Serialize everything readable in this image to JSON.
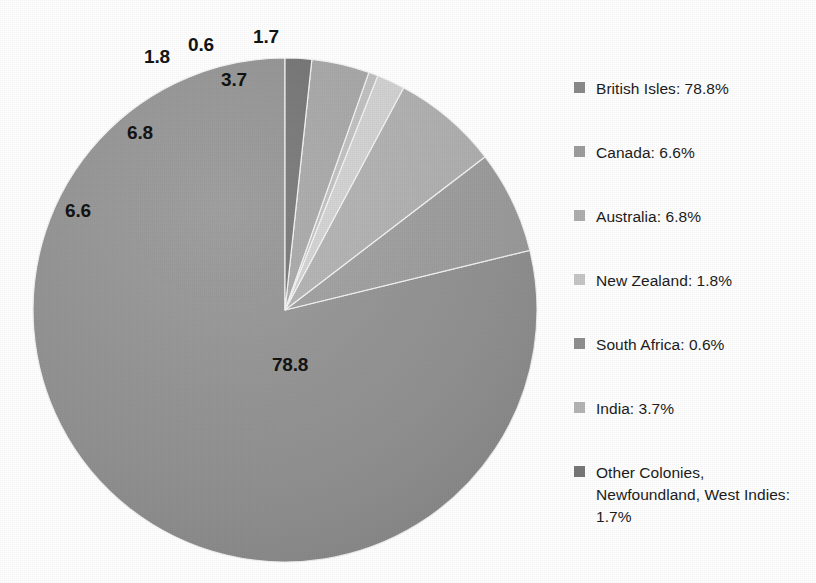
{
  "chart_data": {
    "type": "pie",
    "title": "",
    "labels": [
      "British Isles",
      "Canada",
      "Australia",
      "New Zealand",
      "South Africa",
      "India",
      "Other Colonies, Newfoundland, West Indies"
    ],
    "values": [
      78.8,
      6.6,
      6.8,
      1.8,
      0.6,
      3.7,
      1.7
    ],
    "value_labels": [
      "78.8",
      "6.6",
      "6.8",
      "1.8",
      "0.6",
      "3.7",
      "1.7"
    ],
    "units": "percent",
    "legend_position": "right",
    "grid": false,
    "start_angle_deg": 0,
    "direction": "counterclockwise",
    "colors": [
      "#8f8f8f",
      "#9a9a9a",
      "#adadad",
      "#cfcfcf",
      "#bdbdbd",
      "#a3a3a3",
      "#6f6f6f"
    ]
  },
  "pie": {
    "center_x": 285,
    "center_y": 310,
    "radius": 252,
    "slices": [
      {
        "name": "british-isles",
        "label": "78.8",
        "value": 78.8,
        "start_deg": 0,
        "sweep_deg": 283.68,
        "color": "#8f8f8f",
        "label_x": 290,
        "label_y": 365
      },
      {
        "name": "canada",
        "label": "6.6",
        "value": 6.6,
        "start_deg": 283.68,
        "sweep_deg": 23.76,
        "color": "#9a9a9a",
        "label_x": 78,
        "label_y": 211
      },
      {
        "name": "australia",
        "label": "6.8",
        "value": 6.8,
        "start_deg": 307.44,
        "sweep_deg": 24.48,
        "color": "#adadad",
        "label_x": 140,
        "label_y": 133
      },
      {
        "name": "new-zealand",
        "label": "1.8",
        "value": 1.8,
        "start_deg": 331.92,
        "sweep_deg": 6.48,
        "color": "#cfcfcf",
        "label_x": 157,
        "label_y": 57
      },
      {
        "name": "south-africa",
        "label": "0.6",
        "value": 0.6,
        "start_deg": 338.4,
        "sweep_deg": 2.16,
        "color": "#bdbdbd",
        "label_x": 201,
        "label_y": 45
      },
      {
        "name": "india",
        "label": "3.7",
        "value": 3.7,
        "start_deg": 340.56,
        "sweep_deg": 13.32,
        "color": "#a3a3a3",
        "label_x": 234,
        "label_y": 80
      },
      {
        "name": "other-colonies",
        "label": "1.7",
        "value": 1.7,
        "start_deg": 353.88,
        "sweep_deg": 6.12,
        "color": "#6f6f6f",
        "label_x": 266,
        "label_y": 37
      }
    ]
  },
  "legend": {
    "items": [
      {
        "name": "british-isles",
        "text": "British Isles: 78.8%",
        "swatch": "#8a8a8a",
        "top": 78,
        "lines": 1
      },
      {
        "name": "canada",
        "text": "Canada: 6.6%",
        "swatch": "#9d9d9d",
        "top": 142,
        "lines": 1
      },
      {
        "name": "australia",
        "text": "Australia: 6.8%",
        "swatch": "#aeaeae",
        "top": 206,
        "lines": 1
      },
      {
        "name": "new-zealand",
        "text": "New Zealand: 1.8%",
        "swatch": "#c6c6c6",
        "top": 270,
        "lines": 1
      },
      {
        "name": "south-africa",
        "text": "South Africa: 0.6%",
        "swatch": "#8f8f8f",
        "top": 334,
        "lines": 1
      },
      {
        "name": "india",
        "text": "India: 3.7%",
        "swatch": "#b4b4b4",
        "top": 398,
        "lines": 1
      },
      {
        "name": "other-colonies",
        "text": "Other Colonies, Newfoundland, West Indies: 1.7%",
        "swatch": "#777777",
        "top": 462,
        "lines": 3
      }
    ]
  }
}
